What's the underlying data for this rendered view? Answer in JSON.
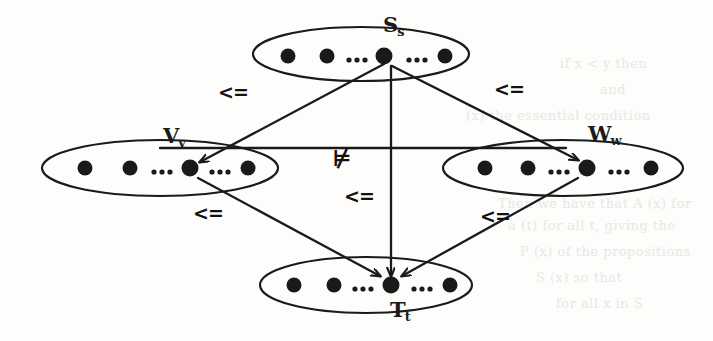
{
  "figure": {
    "type": "node-set-diagram",
    "background_color": "#fdfdfb",
    "ink_color": "#1a1a1a"
  },
  "nodes": [
    {
      "id": "S",
      "label_main": "S",
      "label_sub": "s",
      "cx": 361,
      "cy": 54,
      "rx": 108,
      "ry": 27,
      "label_x": 383,
      "label_y": 12,
      "dots": [
        {
          "x": 288,
          "y": 56,
          "r": 7.5,
          "kind": "big"
        },
        {
          "x": 327,
          "y": 56,
          "r": 7.5,
          "kind": "big"
        },
        {
          "x": 349,
          "y": 60,
          "r": 2.6,
          "kind": "small"
        },
        {
          "x": 357,
          "y": 60,
          "r": 2.6,
          "kind": "small"
        },
        {
          "x": 365,
          "y": 60,
          "r": 2.6,
          "kind": "small"
        },
        {
          "x": 384,
          "y": 56,
          "r": 8.5,
          "kind": "marked"
        },
        {
          "x": 409,
          "y": 60,
          "r": 2.6,
          "kind": "small"
        },
        {
          "x": 417,
          "y": 60,
          "r": 2.6,
          "kind": "small"
        },
        {
          "x": 425,
          "y": 60,
          "r": 2.6,
          "kind": "small"
        },
        {
          "x": 445,
          "y": 56,
          "r": 7.5,
          "kind": "big"
        }
      ]
    },
    {
      "id": "V",
      "label_main": "V",
      "label_sub": "v",
      "cx": 160,
      "cy": 168,
      "rx": 118,
      "ry": 28,
      "label_x": 163,
      "label_y": 123,
      "dots": [
        {
          "x": 85,
          "y": 168,
          "r": 7.5,
          "kind": "big"
        },
        {
          "x": 130,
          "y": 168,
          "r": 7.5,
          "kind": "big"
        },
        {
          "x": 154,
          "y": 172,
          "r": 2.6,
          "kind": "small"
        },
        {
          "x": 162,
          "y": 172,
          "r": 2.6,
          "kind": "small"
        },
        {
          "x": 170,
          "y": 172,
          "r": 2.6,
          "kind": "small"
        },
        {
          "x": 190,
          "y": 168,
          "r": 8.5,
          "kind": "marked"
        },
        {
          "x": 212,
          "y": 172,
          "r": 2.6,
          "kind": "small"
        },
        {
          "x": 220,
          "y": 172,
          "r": 2.6,
          "kind": "small"
        },
        {
          "x": 228,
          "y": 172,
          "r": 2.6,
          "kind": "small"
        },
        {
          "x": 248,
          "y": 168,
          "r": 7.5,
          "kind": "big"
        }
      ]
    },
    {
      "id": "W",
      "label_main": "W",
      "label_sub": "w",
      "cx": 563,
      "cy": 168,
      "rx": 120,
      "ry": 28,
      "label_x": 588,
      "label_y": 121,
      "dots": [
        {
          "x": 485,
          "y": 168,
          "r": 7.5,
          "kind": "big"
        },
        {
          "x": 528,
          "y": 168,
          "r": 7.5,
          "kind": "big"
        },
        {
          "x": 551,
          "y": 172,
          "r": 2.6,
          "kind": "small"
        },
        {
          "x": 559,
          "y": 172,
          "r": 2.6,
          "kind": "small"
        },
        {
          "x": 567,
          "y": 172,
          "r": 2.6,
          "kind": "small"
        },
        {
          "x": 587,
          "y": 168,
          "r": 8.5,
          "kind": "marked"
        },
        {
          "x": 611,
          "y": 172,
          "r": 2.6,
          "kind": "small"
        },
        {
          "x": 619,
          "y": 172,
          "r": 2.6,
          "kind": "small"
        },
        {
          "x": 627,
          "y": 172,
          "r": 2.6,
          "kind": "small"
        },
        {
          "x": 651,
          "y": 168,
          "r": 7.5,
          "kind": "big"
        }
      ]
    },
    {
      "id": "T",
      "label_main": "T",
      "label_sub": "t",
      "cx": 366,
      "cy": 285,
      "rx": 106,
      "ry": 28,
      "label_x": 390,
      "label_y": 297,
      "dots": [
        {
          "x": 294,
          "y": 285,
          "r": 7.5,
          "kind": "big"
        },
        {
          "x": 334,
          "y": 285,
          "r": 7.5,
          "kind": "big"
        },
        {
          "x": 355,
          "y": 289,
          "r": 2.6,
          "kind": "small"
        },
        {
          "x": 363,
          "y": 289,
          "r": 2.6,
          "kind": "small"
        },
        {
          "x": 371,
          "y": 289,
          "r": 2.6,
          "kind": "small"
        },
        {
          "x": 391,
          "y": 285,
          "r": 8.5,
          "kind": "marked"
        },
        {
          "x": 414,
          "y": 289,
          "r": 2.6,
          "kind": "small"
        },
        {
          "x": 422,
          "y": 289,
          "r": 2.6,
          "kind": "small"
        },
        {
          "x": 430,
          "y": 289,
          "r": 2.6,
          "kind": "small"
        },
        {
          "x": 450,
          "y": 285,
          "r": 7.5,
          "kind": "big"
        }
      ]
    }
  ],
  "edges": [
    {
      "id": "S-to-V",
      "from": "S",
      "to": "V",
      "x1": 384,
      "y1": 64,
      "x2": 200,
      "y2": 162,
      "arrow": true,
      "label": "<=",
      "label_x": 218,
      "label_y": 81
    },
    {
      "id": "S-to-W",
      "from": "S",
      "to": "W",
      "x1": 392,
      "y1": 66,
      "x2": 578,
      "y2": 160,
      "arrow": true,
      "label": "<=",
      "label_x": 494,
      "label_y": 78
    },
    {
      "id": "S-to-T",
      "from": "S",
      "to": "T",
      "x1": 391,
      "y1": 66,
      "x2": 391,
      "y2": 276,
      "arrow": true,
      "label": "<=",
      "label_x": 344,
      "label_y": 185
    },
    {
      "id": "V-to-T",
      "from": "V",
      "to": "T",
      "x1": 198,
      "y1": 178,
      "x2": 380,
      "y2": 276,
      "arrow": true,
      "label": "<=",
      "label_x": 193,
      "label_y": 202
    },
    {
      "id": "W-to-T",
      "from": "W",
      "to": "T",
      "x1": 578,
      "y1": 178,
      "x2": 402,
      "y2": 276,
      "arrow": true,
      "label": "<=",
      "label_x": 480,
      "label_y": 205
    },
    {
      "id": "V-to-W-relation",
      "from": "V",
      "to": "W",
      "x1": 160,
      "y1": 148,
      "x2": 566,
      "y2": 148,
      "arrow": false,
      "label": "not-models",
      "label_x": 332,
      "label_y": 147
    }
  ],
  "relation_symbol": {
    "name": "not-models",
    "glyph": "⊭",
    "meaning": "crossed double turnstile"
  },
  "edge_label_text": "<=",
  "background_bleed": [
    {
      "text": "(x) the essential condition",
      "x": 466,
      "y": 108,
      "rotate": 0
    },
    {
      "text": "Then we have that A (x) for",
      "x": 498,
      "y": 196,
      "rotate": 0
    },
    {
      "text": "a (t) for all t, giving the",
      "x": 508,
      "y": 218,
      "rotate": 0
    },
    {
      "text": "P (x) of the propositions",
      "x": 520,
      "y": 244,
      "rotate": 0
    },
    {
      "text": "S (x) so that",
      "x": 536,
      "y": 270,
      "rotate": 0
    },
    {
      "text": "for all x in S",
      "x": 556,
      "y": 296,
      "rotate": 0
    },
    {
      "text": "if x < y then",
      "x": 560,
      "y": 56,
      "rotate": 0
    },
    {
      "text": "and",
      "x": 600,
      "y": 82,
      "rotate": 0
    }
  ]
}
